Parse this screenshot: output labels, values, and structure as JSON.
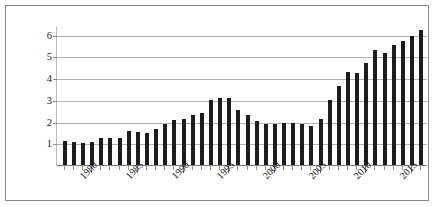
{
  "chart_data": {
    "type": "bar",
    "title": "",
    "subtitle": "",
    "xlabel": "",
    "ylabel": "",
    "grid": true,
    "legend_position": "none",
    "ylim": [
      0,
      6.4
    ],
    "yticks": [
      1,
      2,
      3,
      4,
      5,
      6
    ],
    "ytick_labels": [
      "1",
      "2",
      "3",
      "4",
      "5",
      "6"
    ],
    "xtick_labels": [
      "1980",
      "1985",
      "1990",
      "1995",
      "2000",
      "2005",
      "2010",
      "2015"
    ],
    "xtick_values": [
      1980,
      1985,
      1990,
      1995,
      2000,
      2005,
      2010,
      2015
    ],
    "bar_color": "#1c1c1c",
    "gridline_color": "#b3b3b3",
    "axis_color": "#7d7d7d",
    "categories": [
      "1977",
      "1978",
      "1979",
      "1980",
      "1981",
      "1982",
      "1983",
      "1984",
      "1985",
      "1986",
      "1987",
      "1988",
      "1989",
      "1990",
      "1991",
      "1992",
      "1993",
      "1994",
      "1995",
      "1996",
      "1997",
      "1998",
      "1999",
      "2000",
      "2001",
      "2002",
      "2003",
      "2004",
      "2005",
      "2006",
      "2007",
      "2008",
      "2009",
      "2010",
      "2011",
      "2012",
      "2013",
      "2014",
      "2015",
      "2016"
    ],
    "values": [
      1.15,
      1.1,
      1.05,
      1.1,
      1.3,
      1.3,
      1.3,
      1.6,
      1.55,
      1.52,
      1.72,
      1.95,
      2.1,
      2.15,
      2.35,
      2.45,
      3.05,
      3.15,
      3.15,
      2.6,
      2.35,
      2.05,
      1.95,
      1.95,
      2.0,
      2.0,
      1.92,
      1.85,
      2.15,
      3.05,
      3.7,
      4.35,
      4.3,
      4.75,
      5.35,
      5.2,
      5.55,
      5.75,
      6.0,
      6.25
    ]
  }
}
